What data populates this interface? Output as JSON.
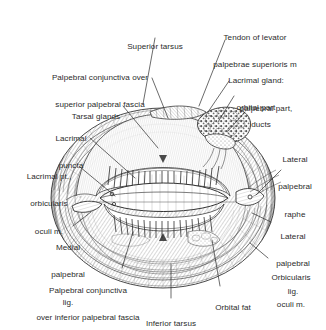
{
  "figure": {
    "kind": "anatomical-illustration",
    "style": "monochrome stipple-and-line engraving",
    "background_color": "#ffffff",
    "ink_color": "#2b2b2b"
  },
  "labels": [
    {
      "id": "superior-tarsus",
      "lines": [
        "Superior tarsus"
      ],
      "x": 155,
      "y": 27,
      "align": "center",
      "leader": [
        [
          155,
          38
        ],
        [
          143,
          104
        ]
      ]
    },
    {
      "id": "tendon-of-levator",
      "lines": [
        "Tendon of levator",
        "palpebrae superioris m"
      ],
      "x": 255,
      "y": 17,
      "align": "center",
      "leader": [
        [
          225,
          40
        ],
        [
          199,
          106
        ]
      ]
    },
    {
      "id": "palpebral-conjunctiva-superior",
      "lines": [
        "Palpebral conjunctiva over",
        "superior palpebral fascia"
      ],
      "x": 100,
      "y": 57,
      "align": "center",
      "leader": [
        [
          152,
          78
        ],
        [
          168,
          118
        ]
      ]
    },
    {
      "id": "lacrimal-gland-orbital-part",
      "lines": [
        "Lacrimal gland:",
        "orbital part"
      ],
      "x": 256,
      "y": 60,
      "align": "center",
      "leader": [
        [
          229,
          81
        ],
        [
          206,
          115
        ]
      ]
    },
    {
      "id": "lacrimal-gland-palpebral-part",
      "lines": [
        "palpebral part,"
      ],
      "x": 265,
      "y": 88,
      "align": "center",
      "leader": [
        [
          234,
          96
        ],
        [
          218,
          122
        ]
      ]
    },
    {
      "id": "lacrimal-gland-ducts",
      "lines": [
        "ducts"
      ],
      "x": 260,
      "y": 104,
      "align": "center",
      "leader": [
        [
          245,
          112
        ],
        [
          228,
          131
        ]
      ]
    },
    {
      "id": "tarsal-glands",
      "lines": [
        "Tarsal glands"
      ],
      "x": 96,
      "y": 96,
      "align": "center",
      "leader": [
        [
          123,
          106
        ],
        [
          158,
          148
        ]
      ]
    },
    {
      "id": "lacrimal-puncta",
      "lines": [
        "Lacrimal",
        "puncta"
      ],
      "x": 71,
      "y": 118,
      "align": "center",
      "leader": [
        [
          90,
          138
        ],
        [
          135,
          178
        ]
      ]
    },
    {
      "id": "lateral-palpebral-raphe",
      "lines": [
        "Lateral",
        "palpebral",
        "raphe"
      ],
      "x": 296,
      "y": 139,
      "align": "center",
      "leader": [
        [
          281,
          170
        ],
        [
          256,
          195
        ]
      ]
    },
    {
      "id": "lacrimal-pt-orbicularis-oculi",
      "lines": [
        "Lacrimal pt.,",
        "orbicularis",
        "oculi m."
      ],
      "x": 49,
      "y": 156,
      "align": "center",
      "leader": [
        [
          80,
          167
        ],
        [
          115,
          196
        ]
      ]
    },
    {
      "id": "lateral-palpebral-lig",
      "lines": [
        "Lateral",
        "palpebral",
        "lig."
      ],
      "x": 293,
      "y": 216,
      "align": "center",
      "leader": [
        [
          271,
          222
        ],
        [
          252,
          213
        ]
      ]
    },
    {
      "id": "medial-palpebral-lig",
      "lines": [
        "Medial",
        "palpebral",
        "lig."
      ],
      "x": 68,
      "y": 227,
      "align": "center",
      "leader": [
        [
          73,
          226
        ],
        [
          91,
          212
        ]
      ]
    },
    {
      "id": "orbicularis-oculi-m",
      "lines": [
        "Orbicularis",
        "oculi m."
      ],
      "x": 291,
      "y": 257,
      "align": "center",
      "leader": [
        [
          268,
          258
        ],
        [
          250,
          243
        ]
      ]
    },
    {
      "id": "palpebral-conjunctiva-inferior",
      "lines": [
        "Palpebral conjunctiva",
        "over inferior palpebral fascia"
      ],
      "x": 88,
      "y": 270,
      "align": "center",
      "leader": [
        [
          122,
          268
        ],
        [
          133,
          232
        ]
      ]
    },
    {
      "id": "orbital-fat",
      "lines": [
        "Orbital fat"
      ],
      "x": 233,
      "y": 287,
      "align": "center",
      "leader": [
        [
          220,
          286
        ],
        [
          212,
          240
        ]
      ]
    },
    {
      "id": "inferior-tarsus",
      "lines": [
        "Inferior tarsus"
      ],
      "x": 171,
      "y": 303,
      "align": "center",
      "leader": [
        [
          171,
          298
        ],
        [
          171,
          264
        ]
      ]
    }
  ],
  "structures": [
    "superior tarsus",
    "inferior tarsus",
    "tarsal glands",
    "lacrimal puncta",
    "lacrimal gland orbital part",
    "lacrimal gland palpebral part",
    "lacrimal gland ducts",
    "tendon of levator palpebrae superioris",
    "palpebral conjunctiva",
    "medial palpebral ligament",
    "lateral palpebral ligament",
    "lateral palpebral raphe",
    "orbicularis oculi muscle",
    "lacrimal part of orbicularis oculi",
    "orbital fat"
  ]
}
